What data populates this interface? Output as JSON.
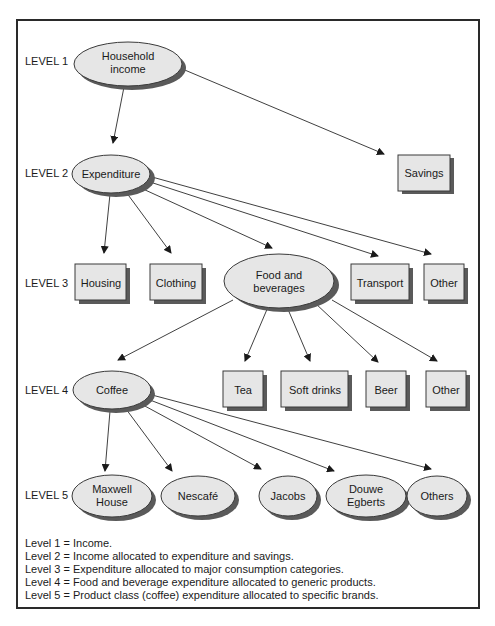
{
  "levels": [
    "LEVEL 1",
    "LEVEL 2",
    "LEVEL 3",
    "LEVEL 4",
    "LEVEL 5"
  ],
  "nodes": {
    "household_income": {
      "line1": "Household",
      "line2": "income",
      "shape": "ellipse"
    },
    "expenditure": {
      "label": "Expenditure",
      "shape": "ellipse"
    },
    "savings": {
      "label": "Savings",
      "shape": "box"
    },
    "housing": {
      "label": "Housing",
      "shape": "box"
    },
    "clothing": {
      "label": "Clothing",
      "shape": "box"
    },
    "food_beverages": {
      "line1": "Food and",
      "line2": "beverages",
      "shape": "ellipse"
    },
    "transport": {
      "label": "Transport",
      "shape": "box"
    },
    "other_l3": {
      "label": "Other",
      "shape": "box"
    },
    "coffee": {
      "label": "Coffee",
      "shape": "ellipse"
    },
    "tea": {
      "label": "Tea",
      "shape": "box"
    },
    "soft_drinks": {
      "label": "Soft drinks",
      "shape": "box"
    },
    "beer": {
      "label": "Beer",
      "shape": "box"
    },
    "other_l4": {
      "label": "Other",
      "shape": "box"
    },
    "maxwell_house": {
      "line1": "Maxwell",
      "line2": "House",
      "shape": "ellipse"
    },
    "nescafe": {
      "label": "Nescafé",
      "shape": "ellipse"
    },
    "jacobs": {
      "label": "Jacobs",
      "shape": "ellipse"
    },
    "douwe_egberts": {
      "line1": "Douwe",
      "line2": "Egberts",
      "shape": "ellipse"
    },
    "others": {
      "label": "Others",
      "shape": "ellipse"
    }
  },
  "edges": [
    [
      "household_income",
      "expenditure"
    ],
    [
      "household_income",
      "savings"
    ],
    [
      "expenditure",
      "housing"
    ],
    [
      "expenditure",
      "clothing"
    ],
    [
      "expenditure",
      "food_beverages"
    ],
    [
      "expenditure",
      "transport"
    ],
    [
      "expenditure",
      "other_l3"
    ],
    [
      "food_beverages",
      "coffee"
    ],
    [
      "food_beverages",
      "tea"
    ],
    [
      "food_beverages",
      "soft_drinks"
    ],
    [
      "food_beverages",
      "beer"
    ],
    [
      "food_beverages",
      "other_l4"
    ],
    [
      "coffee",
      "maxwell_house"
    ],
    [
      "coffee",
      "nescafe"
    ],
    [
      "coffee",
      "jacobs"
    ],
    [
      "coffee",
      "douwe_egberts"
    ],
    [
      "coffee",
      "others"
    ]
  ],
  "legend": [
    "Level 1 = Income.",
    "Level 2 = Income allocated to expenditure and savings.",
    "Level 3 = Expenditure allocated to major consumption categories.",
    "Level 4 = Food and beverage expenditure allocated to generic products.",
    "Level 5 = Product class (coffee) expenditure allocated to specific brands."
  ]
}
